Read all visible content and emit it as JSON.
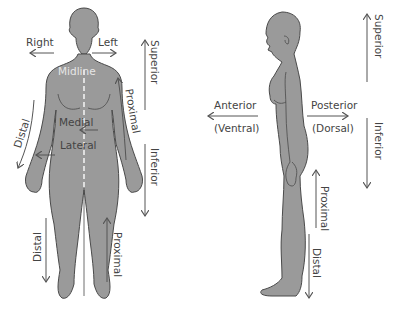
{
  "colors": {
    "background": "#ffffff",
    "figure_fill": "#9a9a9a",
    "figure_outline": "#4a4a4a",
    "label_text": "#444444",
    "arrow": "#555555",
    "midline": "#e6e6e6"
  },
  "front_figure": {
    "labels": {
      "right": "Right",
      "left": "Left",
      "midline": "Midline",
      "medial": "Medial",
      "lateral": "Lateral",
      "distal_arm": "Distal",
      "proximal_arm": "Proximal",
      "superior": "Superior",
      "inferior": "Inferior",
      "distal_leg": "Distal",
      "proximal_leg": "Proximal"
    }
  },
  "side_figure": {
    "labels": {
      "anterior": "Anterior",
      "ventral": "(Ventral)",
      "posterior": "Posterior",
      "dorsal": "(Dorsal)",
      "superior": "Superior",
      "inferior": "Inferior",
      "proximal": "Proximal",
      "distal": "Distal"
    }
  }
}
